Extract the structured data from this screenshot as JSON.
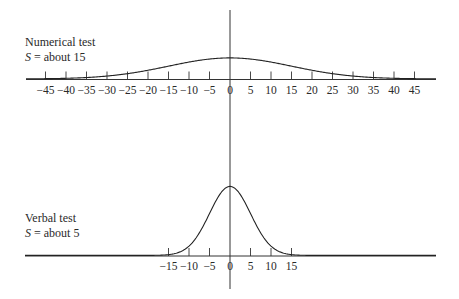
{
  "chart_data": [
    {
      "type": "line",
      "title": "Numerical test",
      "subtitle": "S = about 15",
      "distribution": "normal",
      "mean": 0,
      "sd": 15,
      "x_ticks": [
        -45,
        -40,
        -35,
        -30,
        -25,
        -20,
        -15,
        -10,
        -5,
        0,
        5,
        10,
        15,
        20,
        25,
        30,
        35,
        40,
        45
      ],
      "tick_labels": [
        "−45",
        "−40",
        "−35",
        "−30",
        "−25",
        "−20",
        "−15",
        "−10",
        "−5",
        "0",
        "5",
        "10",
        "15",
        "20",
        "25",
        "30",
        "35",
        "40",
        "45"
      ],
      "xlim": [
        -50,
        50
      ],
      "grid": false,
      "xlabel": "",
      "ylabel": ""
    },
    {
      "type": "line",
      "title": "Verbal test",
      "subtitle": "S = about 5",
      "distribution": "normal",
      "mean": 0,
      "sd": 5,
      "x_ticks": [
        -15,
        -10,
        -5,
        0,
        5,
        10,
        15
      ],
      "tick_labels": [
        "−15",
        "−10",
        "−5",
        "0",
        "5",
        "10",
        "15"
      ],
      "xlim": [
        -50,
        50
      ],
      "grid": false,
      "xlabel": "",
      "ylabel": ""
    }
  ],
  "labels": {
    "top_title": "Numerical test",
    "top_sd_prefix": "S",
    "top_sd_rest": " = about 15",
    "bottom_title": "Verbal test",
    "bottom_sd_prefix": "S",
    "bottom_sd_rest": " = about 5"
  },
  "colors": {
    "ink": "#2a2a2a",
    "background": "#ffffff"
  }
}
